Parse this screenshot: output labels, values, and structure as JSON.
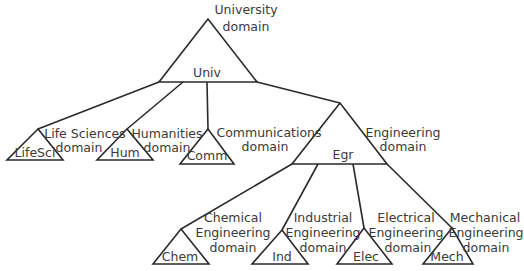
{
  "diagram": {
    "root": {
      "node": "Univ",
      "domain_line1": "University",
      "domain_line2": "domain"
    },
    "children": [
      {
        "node": "LifeSci",
        "domain_line1": "Life Sciences",
        "domain_line2": "domain"
      },
      {
        "node": "Hum",
        "domain_line1": "Humanities",
        "domain_line2": "domain"
      },
      {
        "node": "Comm",
        "domain_line1": "Communications",
        "domain_line2": "domain"
      },
      {
        "node": "Egr",
        "domain_line1": "Engineering",
        "domain_line2": "domain"
      }
    ],
    "engineering_children": [
      {
        "node": "Chem",
        "domain_line1": "Chemical",
        "domain_line2": "Engineering",
        "domain_line3": "domain"
      },
      {
        "node": "Ind",
        "domain_line1": "Industrial",
        "domain_line2": "Engineering",
        "domain_line3": "domain"
      },
      {
        "node": "Elec",
        "domain_line1": "Electrical",
        "domain_line2": "Engineering",
        "domain_line3": "domain"
      },
      {
        "node": "Mech",
        "domain_line1": "Mechanical",
        "domain_line2": "Engineering",
        "domain_line3": "domain"
      }
    ],
    "colors": {
      "line": "#2a2a2a",
      "text": "#3a3a3a",
      "background": "#ffffff"
    }
  }
}
